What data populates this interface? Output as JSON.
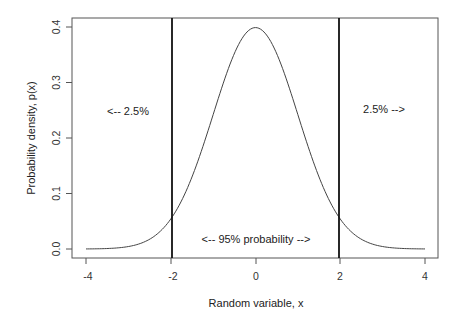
{
  "chart_data": {
    "type": "line",
    "title": "",
    "xlabel": "Random variable, x",
    "ylabel": "Probability density, p(x)",
    "xlim": [
      -4,
      4
    ],
    "ylim": [
      0,
      0.4
    ],
    "xticks": [
      "-4",
      "-2",
      "0",
      "2",
      "4"
    ],
    "yticks": [
      "0.0",
      "0.1",
      "0.2",
      "0.3",
      "0.4"
    ],
    "grid": false,
    "series": [
      {
        "name": "Standard normal density",
        "x": [
          -4,
          -3.5,
          -3,
          -2.5,
          -2,
          -1.5,
          -1,
          -0.5,
          0,
          0.5,
          1,
          1.5,
          2,
          2.5,
          3,
          3.5,
          4
        ],
        "y": [
          0.0001,
          0.0009,
          0.0044,
          0.0175,
          0.054,
          0.1295,
          0.242,
          0.3521,
          0.3989,
          0.3521,
          0.242,
          0.1295,
          0.054,
          0.0175,
          0.0044,
          0.0009,
          0.0001
        ]
      }
    ],
    "vertical_lines": [
      -1.96,
      1.96
    ],
    "annotations": [
      {
        "text": "<-- 2.5%",
        "x": -3.0,
        "y": 0.25
      },
      {
        "text": "2.5% -->",
        "x": 3.0,
        "y": 0.25
      },
      {
        "text": "<-- 95% probability -->",
        "x": 0,
        "y": 0.02
      }
    ]
  }
}
